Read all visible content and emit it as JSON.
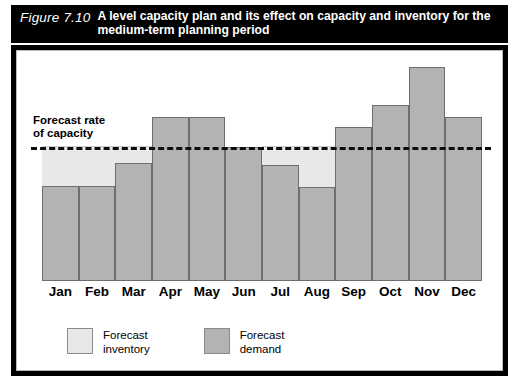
{
  "figure": {
    "number": "Figure 7.10",
    "caption": "A level capacity plan and its effect on capacity and inventory for the medium-term planning period"
  },
  "annotations": {
    "capacity_label": "Forecast rate\nof capacity"
  },
  "legend": {
    "items": [
      {
        "label": "Forecast\ninventory",
        "color": "#e8e8e8",
        "key": "inventory"
      },
      {
        "label": "Forecast\ndemand",
        "color": "#b3b3b3",
        "key": "demand"
      }
    ]
  },
  "colors": {
    "title_bar_background": "#000000",
    "title_text": "#ffffff",
    "demand_bar": "#b3b3b3",
    "demand_bar_border": "#6e6e6e",
    "inventory_band": "#e8e8e8",
    "capacity_line": "#0d0d0d",
    "panel_background": "#ffffff"
  },
  "chart_data": {
    "type": "bar",
    "title": "A level capacity plan and its effect on capacity and inventory for the medium-term planning period",
    "xlabel": "",
    "ylabel": "",
    "categories": [
      "Jan",
      "Feb",
      "Mar",
      "Apr",
      "May",
      "Jun",
      "Jul",
      "Aug",
      "Sep",
      "Oct",
      "Nov",
      "Dec"
    ],
    "series": [
      {
        "name": "Forecast demand",
        "values": [
          71,
          71,
          88,
          123,
          123,
          100,
          87,
          70,
          115,
          132,
          160,
          123
        ]
      }
    ],
    "reference_line": {
      "name": "Forecast rate of capacity",
      "value": 100,
      "style": "dashed"
    },
    "inventory_band": {
      "name": "Forecast inventory",
      "description": "Shaded region between forecast demand and the level capacity line, shown where demand is below capacity",
      "months": [
        "Jan",
        "Feb",
        "Mar",
        "Jul",
        "Aug"
      ]
    },
    "ylim": [
      0,
      172
    ],
    "units": "% of forecast rate of capacity",
    "grid": false,
    "legend_position": "bottom-left"
  }
}
